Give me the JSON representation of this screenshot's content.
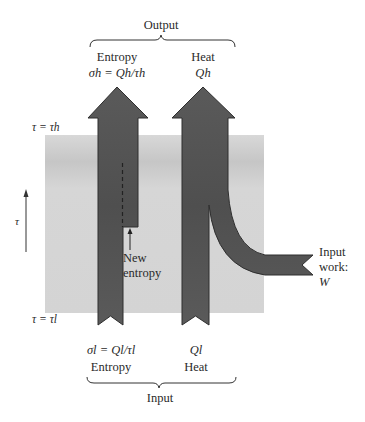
{
  "diagram": {
    "output_group": {
      "label": "Output",
      "entropy": {
        "title": "Entropy",
        "formula": "σh = Qh/τh"
      },
      "heat": {
        "title": "Heat",
        "formula": "Qh"
      }
    },
    "input_group": {
      "label": "Input",
      "entropy": {
        "title": "Entropy",
        "formula": "σl = Ql/τl"
      },
      "heat": {
        "title": "Heat",
        "formula": "Ql"
      }
    },
    "temperature_levels": {
      "high": "τ = τh",
      "low": "τ = τl"
    },
    "axis_label": "τ",
    "new_entropy_label": [
      "New",
      "entropy"
    ],
    "work_label": [
      "Input",
      "work:",
      "W"
    ],
    "colors": {
      "arrow_fill": "#575757",
      "arrow_stroke": "#2e2e2e",
      "band_fill": "#d6d6d6",
      "band_dark": "#c4c4c4",
      "text": "#2a2a2a"
    }
  }
}
